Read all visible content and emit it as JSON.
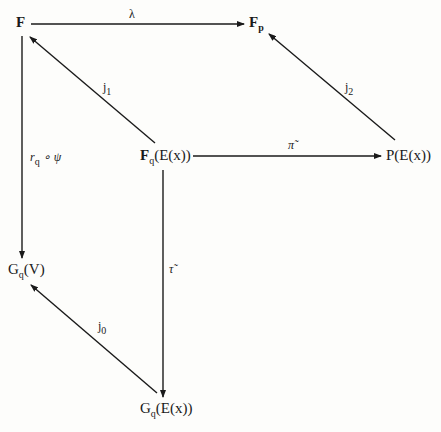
{
  "diagram": {
    "type": "commutative-diagram",
    "nodes": {
      "F": {
        "main": "F",
        "sub": ""
      },
      "Fp": {
        "main": "F",
        "sub": "p"
      },
      "FqEx": {
        "main": "F",
        "sub": "q",
        "rest": "(E(x))"
      },
      "PEx": {
        "main": "P(E(x))"
      },
      "GqV": {
        "main": "G",
        "sub": "q",
        "rest": "(V)"
      },
      "GqEx": {
        "main": "G",
        "sub": "q",
        "rest": "(E(x))"
      }
    },
    "arrows": {
      "lambda": {
        "label": "λ",
        "from": "F",
        "to": "F_p"
      },
      "j1": {
        "label": "j",
        "sub": "1",
        "from": "F_q(E(x))",
        "to": "F"
      },
      "j2": {
        "label": "j",
        "sub": "2",
        "from": "P(E(x))",
        "to": "F_p"
      },
      "pi": {
        "label": "π̃",
        "from": "F_q(E(x))",
        "to": "P(E(x))"
      },
      "rq_psi": {
        "label": "r",
        "sub": "q",
        "rest": " ∘ ψ",
        "from": "F",
        "to": "G_q(V)"
      },
      "tau": {
        "label": "τ̃",
        "from": "F_q(E(x))",
        "to": "G_q(E(x))"
      },
      "j0": {
        "label": "j",
        "sub": "0",
        "from": "G_q(E(x))",
        "to": "G_q(V)"
      }
    }
  }
}
